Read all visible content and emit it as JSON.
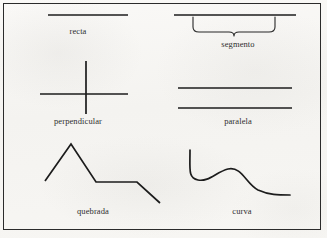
{
  "page": {
    "background_color": "#f6f5f3",
    "border_color": "#2b2b2b",
    "ink_color": "#1c1c1c",
    "text_color": "#2e2e2e",
    "width": 327,
    "height": 238
  },
  "figures": [
    {
      "id": "recta",
      "label": "recta",
      "shape": "straight-line",
      "description": "una línea recta horizontal"
    },
    {
      "id": "segmento",
      "label": "segmento",
      "shape": "line-with-brace",
      "description": "línea horizontal con llave que marca un tramo"
    },
    {
      "id": "perpendicular",
      "label": "perpendicular",
      "shape": "cross",
      "description": "dos rectas que se cruzan en ángulo recto"
    },
    {
      "id": "paralela",
      "label": "paralela",
      "shape": "parallel-lines",
      "description": "dos rectas paralelas horizontales"
    },
    {
      "id": "quebrada",
      "label": "quebrada",
      "shape": "polyline",
      "description": "línea quebrada en zigzag"
    },
    {
      "id": "curva",
      "label": "curva",
      "shape": "curve",
      "description": "línea curva ondulada"
    }
  ]
}
